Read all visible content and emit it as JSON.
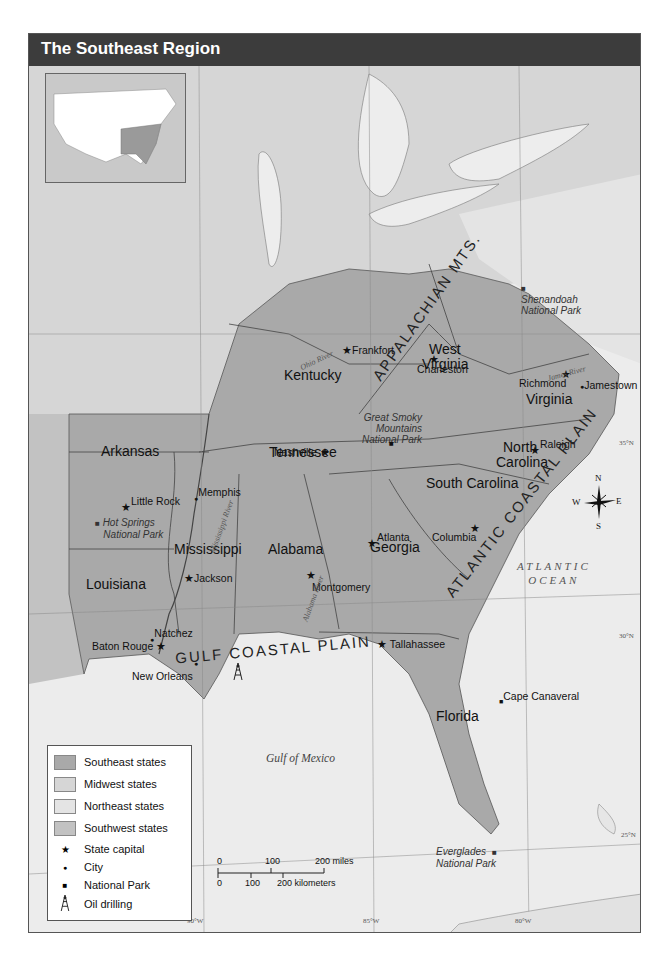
{
  "title": "The Southeast Region",
  "colors": {
    "southeast": "#a9a9a9",
    "midwest": "#d6d6d6",
    "northeast": "#e4e4e4",
    "southwest": "#c2c2c2",
    "water": "#ececec",
    "title_bar": "#3c3c3c"
  },
  "states": {
    "kentucky": "Kentucky",
    "west_virginia_1": "West",
    "west_virginia_2": "Virginia",
    "virginia": "Virginia",
    "north_carolina_1": "North",
    "north_carolina_2": "Carolina",
    "tennessee": "Tennessee",
    "arkansas": "Arkansas",
    "south_carolina": "South Carolina",
    "mississippi": "Mississippi",
    "alabama": "Alabama",
    "georgia": "Georgia",
    "louisiana": "Louisiana",
    "florida": "Florida"
  },
  "capitals": {
    "frankfort": "Frankfort",
    "charleston": "Charleston",
    "richmond": "Richmond",
    "nashville": "Nashville",
    "raleigh": "Raleigh",
    "little_rock": "Little Rock",
    "columbia": "Columbia",
    "atlanta": "Atlanta",
    "jackson": "Jackson",
    "montgomery": "Montgomery",
    "baton_rouge": "Baton Rouge",
    "tallahassee": "Tallahassee"
  },
  "cities": {
    "jamestown": "Jamestown",
    "memphis": "Memphis",
    "natchez": "Natchez",
    "new_orleans": "New Orleans",
    "cape_canaveral": "Cape Canaveral"
  },
  "parks": {
    "shenandoah_1": "Shenandoah",
    "shenandoah_2": "National Park",
    "smoky_1": "Great Smoky",
    "smoky_2": "Mountains",
    "smoky_3": "National Park",
    "hot_springs_1": "Hot Springs",
    "hot_springs_2": "National Park",
    "everglades_1": "Everglades",
    "everglades_2": "National Park"
  },
  "rivers": {
    "ohio": "Ohio River",
    "mississippi": "Mississippi River",
    "james": "James River",
    "alabama": "Alabama River"
  },
  "terrain": {
    "appalachian": "APPALACHIAN MTS.",
    "atlantic_plain": "ATLANTIC COASTAL PLAIN",
    "gulf_plain": "GULF COASTAL PLAIN"
  },
  "water_bodies": {
    "atlantic_1": "ATLANTIC",
    "atlantic_2": "OCEAN",
    "gulf": "Gulf of Mexico"
  },
  "graticule": {
    "lat35": "35°N",
    "lat30": "30°N",
    "lat25": "25°N",
    "lon90": "90°W",
    "lon85": "85°W",
    "lon80": "80°W"
  },
  "compass": {
    "n": "N",
    "s": "S",
    "e": "E",
    "w": "W"
  },
  "legend": {
    "items": [
      {
        "label": "Southeast states",
        "type": "swatch",
        "color": "#a9a9a9"
      },
      {
        "label": "Midwest states",
        "type": "swatch",
        "color": "#d6d6d6"
      },
      {
        "label": "Northeast states",
        "type": "swatch",
        "color": "#e4e4e4"
      },
      {
        "label": "Southwest states",
        "type": "swatch",
        "color": "#c2c2c2"
      },
      {
        "label": "State capital",
        "type": "symbol",
        "symbol": "★"
      },
      {
        "label": "City",
        "type": "symbol",
        "symbol": "●"
      },
      {
        "label": "National Park",
        "type": "symbol",
        "symbol": "■"
      },
      {
        "label": "Oil drilling",
        "type": "symbol",
        "symbol": "oil-derrick"
      }
    ]
  },
  "scale": {
    "miles_0": "0",
    "miles_100": "100",
    "miles_200": "200 miles",
    "km_0": "0",
    "km_100": "100",
    "km_200": "200 kilometers"
  }
}
